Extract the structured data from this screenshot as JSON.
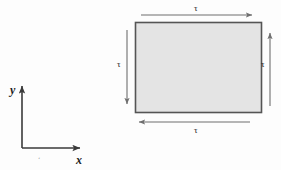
{
  "figure": {
    "type": "mechanics-shear-stress-diagram",
    "background_color": "#fdfdfd",
    "width": 281,
    "height": 170
  },
  "element": {
    "name": "stress-element",
    "shape": "rectangle",
    "fill_color": "#e4e4e4",
    "stroke_color": "#555555",
    "x": 135,
    "y": 22,
    "width": 127,
    "height": 91
  },
  "axes": {
    "origin_x": 22,
    "origin_y": 148,
    "color": "#3a3a3a",
    "x_axis": {
      "label": "x",
      "direction": "right",
      "length": 58,
      "label_x": 76,
      "label_y": 154
    },
    "y_axis": {
      "label": "y",
      "direction": "up",
      "length": 62,
      "label_x": 10,
      "label_y": 84
    }
  },
  "shear_arrows": [
    {
      "name": "top-shear-arrow",
      "label": "τ",
      "direction": "right",
      "position": "top",
      "x1": 141,
      "y1": 15,
      "x2": 252,
      "y2": 15,
      "label_x": 194,
      "label_y": 4
    },
    {
      "name": "bottom-shear-arrow",
      "label": "τ",
      "direction": "left",
      "position": "bottom",
      "x1": 250,
      "y1": 122,
      "x2": 139,
      "y2": 122,
      "label_x": 194,
      "label_y": 126
    },
    {
      "name": "left-shear-arrow",
      "label": "τ",
      "direction": "down",
      "position": "left",
      "x1": 127,
      "y1": 30,
      "x2": 127,
      "y2": 104,
      "label_x": 117,
      "label_y": 60
    },
    {
      "name": "right-shear-arrow",
      "label": "τ",
      "direction": "up",
      "position": "right",
      "x1": 270,
      "y1": 106,
      "x2": 270,
      "y2": 33,
      "label_x": 261,
      "label_y": 60
    }
  ],
  "artifacts": {
    "speck_mark": "‘",
    "speck_x": 38,
    "speck_y": 156
  },
  "colors": {
    "arrow_stroke": "#6f6f6f",
    "axis_stroke": "#3a3a3a",
    "element_fill": "#e4e4e4",
    "element_stroke": "#555555",
    "text": "#1c1c1c"
  }
}
